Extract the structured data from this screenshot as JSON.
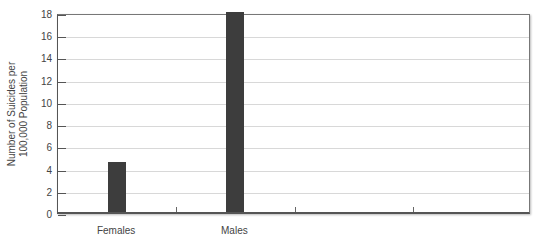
{
  "chart_data": {
    "type": "bar",
    "title": "",
    "xlabel": "",
    "ylabel": "Number of Suicides per 100,000 Population",
    "ylabel_lines": [
      "Number of Suicides per",
      "100,000 Population"
    ],
    "categories": [
      "Females",
      "Males",
      "",
      ""
    ],
    "values": [
      4.5,
      18,
      null,
      null
    ],
    "ylim": [
      0,
      18
    ],
    "yticks": [
      0,
      2,
      4,
      6,
      8,
      10,
      12,
      14,
      16,
      18
    ],
    "grid": true,
    "legend": null,
    "bar_color": "#3d3d3d"
  }
}
